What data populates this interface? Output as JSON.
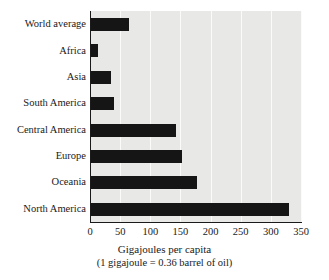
{
  "chart_data": {
    "type": "bar",
    "orientation": "horizontal",
    "title": "",
    "xlabel": "Gigajoules per capita",
    "xsublabel": "(1 gigajoule = 0.36 barrel of oil)",
    "ylabel": "",
    "categories": [
      "World average",
      "Africa",
      "Asia",
      "South America",
      "Central America",
      "Europe",
      "Oceania",
      "North America"
    ],
    "values": [
      65,
      14,
      35,
      39,
      143,
      152,
      177,
      330
    ],
    "xlim": [
      0,
      350
    ],
    "xticks": [
      0,
      50,
      100,
      150,
      200,
      250,
      300,
      350
    ],
    "xtick_labels": [
      "0",
      "50",
      "100",
      "150",
      "200",
      "250",
      "300",
      "350"
    ],
    "grid": "vertical",
    "legend": "none",
    "bar_color": "#151515",
    "plot_background": "#e8e8e6",
    "gridline_color": "#fbfbfa",
    "axis_color": "#1a1a1a",
    "page_background": "#ffffff"
  }
}
